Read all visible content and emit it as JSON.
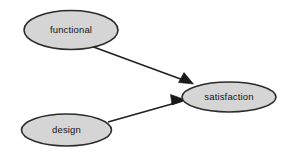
{
  "diagram": {
    "background_color": "#ffffff",
    "canvas": {
      "width": 297,
      "height": 160
    },
    "style": {
      "node_fill": "#d5d5d5",
      "node_stroke": "#2b2b2b",
      "label_color": "#141414",
      "edge_color": "#1f1f1f",
      "arrowhead_fill": "#1a1a1a"
    },
    "nodes": [
      {
        "id": "functional",
        "label": "functional",
        "shape": "ellipse",
        "cx": 71,
        "cy": 30,
        "rx": 47,
        "ry": 19.5
      },
      {
        "id": "design",
        "label": "design",
        "shape": "ellipse",
        "cx": 66.5,
        "cy": 130,
        "rx": 45,
        "ry": 16
      },
      {
        "id": "satisfaction",
        "label": "satisfaction",
        "shape": "ellipse",
        "cx": 229,
        "cy": 97,
        "rx": 47,
        "ry": 15
      }
    ],
    "edges": [
      {
        "id": "functional-to-satisfaction",
        "from": "functional",
        "to": "satisfaction",
        "directed": true,
        "line": "M 89.5,45.5 L 190,82.5",
        "arrowhead": "M 193.5,84 L 178.5,82.5 L 184,72.5 Z"
      },
      {
        "id": "design-to-satisfaction",
        "from": "design",
        "to": "satisfaction",
        "directed": true,
        "line": "M 108,122 L 182.5,101",
        "arrowhead": "M 186,100 L 172,105 L 170.5,94.5 Z"
      }
    ]
  }
}
